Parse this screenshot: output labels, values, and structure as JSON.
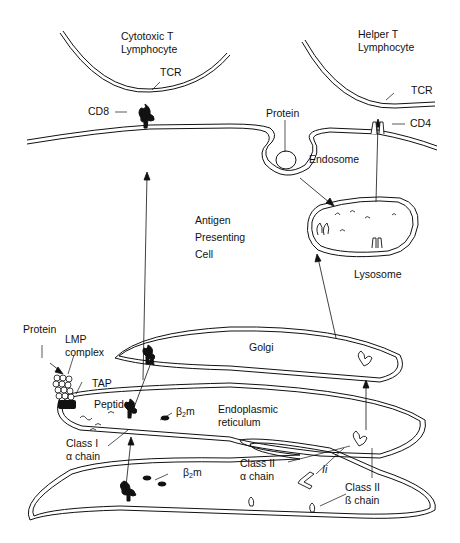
{
  "diagram": {
    "type": "biological-pathway"
  },
  "cells": {
    "cytotoxic_t": {
      "line1": "Cytotoxic T",
      "line2": "Lymphocyte"
    },
    "helper_t": {
      "line1": "Helper T",
      "line2": "Lymphocyte"
    },
    "apc": {
      "line1": "Antigen",
      "line2": "Presenting",
      "line3": "Cell"
    }
  },
  "labels": {
    "tcr_left": "TCR",
    "cd8": "CD8",
    "tcr_right": "TCR",
    "cd4": "CD4",
    "protein_endosome": "Protein",
    "endosome": "Endosome",
    "lysosome": "Lysosome",
    "protein_cytosol": "Protein",
    "lmp_line1": "LMP",
    "lmp_line2": "complex",
    "tap": "TAP",
    "peptides": "Peptides",
    "golgi": "Golgi",
    "er_line1": "Endoplasmic",
    "er_line2": "reticulum",
    "beta2m_upper_base": "β",
    "beta2m_upper_sub": "2",
    "beta2m_upper_m": "m",
    "beta2m_lower_base": "β",
    "beta2m_lower_sub": "2",
    "beta2m_lower_m": "m",
    "class1_line1": "Class I",
    "class1_line2": "α chain",
    "class2a_line1": "Class II",
    "class2a_line2": "α chain",
    "class2b_line1": "Class II",
    "class2b_line2": "ß chain",
    "invariant_chain": "Ii"
  }
}
